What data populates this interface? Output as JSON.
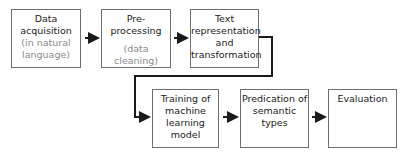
{
  "diagram": {
    "steps": [
      {
        "title": [
          "Data",
          "acquisition"
        ],
        "note": [
          "(in natural",
          "language)"
        ]
      },
      {
        "title": [
          "Pre-processing"
        ],
        "note": [
          "(data",
          "cleaning)"
        ]
      },
      {
        "title": [
          "Text",
          "representation",
          "and",
          "transformation"
        ],
        "note": []
      },
      {
        "title": [
          "Training of",
          "machine",
          "learning model"
        ],
        "note": []
      },
      {
        "title": [
          "Predication of",
          "semantic types"
        ],
        "note": []
      },
      {
        "title": [
          "Evaluation"
        ],
        "note": []
      }
    ],
    "colors": {
      "border": "#6f6f6f",
      "arrow": "#1a1a1a",
      "note_text": "#8a8a8a"
    }
  }
}
